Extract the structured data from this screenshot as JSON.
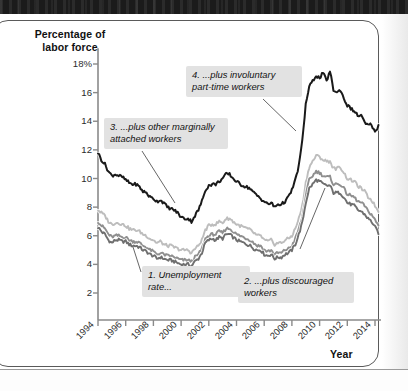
{
  "figure": {
    "y_axis_title": "Percentage of\nlabor force",
    "x_axis_title": "Year",
    "y_ticks": [
      "18%",
      "16",
      "14",
      "12",
      "10",
      "8",
      "6",
      "4",
      "2"
    ],
    "x_ticks": [
      "1994",
      "1996",
      "1998",
      "2000",
      "2002",
      "2004",
      "2006",
      "2008",
      "2010",
      "2012",
      "2014"
    ],
    "callouts": [
      {
        "id": "callout-1",
        "text": "1. Unemployment\nrate..."
      },
      {
        "id": "callout-2",
        "text": "2. ...plus discouraged\nworkers"
      },
      {
        "id": "callout-3",
        "text": "3. ...plus other marginally\nattached workers"
      },
      {
        "id": "callout-4",
        "text": "4. ...plus involuntary\npart-time workers"
      }
    ],
    "colors": {
      "series_u3": "#6f6f6f",
      "series_u4": "#8f8f8f",
      "series_u5": "#bdbdbd",
      "series_u6": "#1a1a1a",
      "axis": "#8a8a8a",
      "callout_bg": "#e2e2e2",
      "frame": "#5a5a5a"
    }
  },
  "chart_data": {
    "type": "line",
    "title": "",
    "subtitle": "",
    "xlabel": "Year",
    "ylabel": "Percentage of labor force",
    "xlim": [
      1994,
      2014.4
    ],
    "ylim": [
      0,
      19
    ],
    "grid": false,
    "legend": "annotations",
    "x_tick_values": [
      1994,
      1996,
      1998,
      2000,
      2002,
      2004,
      2006,
      2008,
      2010,
      2012,
      2014
    ],
    "y_tick_values": [
      2,
      4,
      6,
      8,
      10,
      12,
      14,
      16,
      18
    ],
    "x": [
      1994.0,
      1994.25,
      1994.5,
      1994.75,
      1995.0,
      1995.25,
      1995.5,
      1995.75,
      1996.0,
      1996.25,
      1996.5,
      1996.75,
      1997.0,
      1997.25,
      1997.5,
      1997.75,
      1998.0,
      1998.25,
      1998.5,
      1998.75,
      1999.0,
      1999.25,
      1999.5,
      1999.75,
      2000.0,
      2000.25,
      2000.5,
      2000.75,
      2001.0,
      2001.25,
      2001.5,
      2001.75,
      2002.0,
      2002.25,
      2002.5,
      2002.75,
      2003.0,
      2003.25,
      2003.5,
      2003.75,
      2004.0,
      2004.25,
      2004.5,
      2004.75,
      2005.0,
      2005.25,
      2005.5,
      2005.75,
      2006.0,
      2006.25,
      2006.5,
      2006.75,
      2007.0,
      2007.25,
      2007.5,
      2007.75,
      2008.0,
      2008.25,
      2008.5,
      2008.75,
      2009.0,
      2009.25,
      2009.5,
      2009.75,
      2010.0,
      2010.25,
      2010.5,
      2010.75,
      2011.0,
      2011.25,
      2011.5,
      2011.75,
      2012.0,
      2012.25,
      2012.5,
      2012.75,
      2013.0,
      2013.25,
      2013.5,
      2013.75,
      2014.0,
      2014.25
    ],
    "series": [
      {
        "name": "1. Unemployment rate (U-3)",
        "color": "#6f6f6f",
        "values": [
          6.6,
          6.3,
          6.1,
          5.7,
          5.5,
          5.7,
          5.7,
          5.6,
          5.6,
          5.4,
          5.3,
          5.3,
          5.2,
          5.0,
          4.9,
          4.7,
          4.6,
          4.4,
          4.5,
          4.4,
          4.3,
          4.3,
          4.2,
          4.1,
          4.0,
          4.0,
          4.0,
          3.9,
          4.2,
          4.4,
          4.8,
          5.5,
          5.7,
          5.8,
          5.7,
          5.9,
          5.8,
          6.1,
          6.1,
          5.9,
          5.7,
          5.6,
          5.5,
          5.4,
          5.3,
          5.1,
          5.0,
          5.0,
          4.7,
          4.6,
          4.7,
          4.4,
          4.5,
          4.5,
          4.7,
          4.8,
          5.0,
          5.4,
          6.1,
          6.9,
          8.3,
          9.3,
          9.6,
          9.9,
          9.8,
          9.6,
          9.5,
          9.5,
          9.0,
          9.0,
          9.0,
          8.7,
          8.3,
          8.2,
          8.1,
          7.8,
          7.7,
          7.5,
          7.2,
          7.0,
          6.6,
          6.2
        ]
      },
      {
        "name": "2. ...plus discouraged workers (U-4)",
        "color": "#8f8f8f",
        "values": [
          7.0,
          6.7,
          6.5,
          6.1,
          5.9,
          6.0,
          6.0,
          5.9,
          5.9,
          5.7,
          5.6,
          5.6,
          5.5,
          5.3,
          5.2,
          5.0,
          4.9,
          4.7,
          4.8,
          4.7,
          4.6,
          4.6,
          4.5,
          4.4,
          4.3,
          4.3,
          4.3,
          4.2,
          4.5,
          4.7,
          5.1,
          5.8,
          6.0,
          6.1,
          6.1,
          6.3,
          6.2,
          6.5,
          6.5,
          6.3,
          6.1,
          6.0,
          5.9,
          5.8,
          5.7,
          5.5,
          5.3,
          5.3,
          5.0,
          4.9,
          5.0,
          4.7,
          4.8,
          4.8,
          5.0,
          5.1,
          5.3,
          5.8,
          6.5,
          7.3,
          8.8,
          9.9,
          10.2,
          10.5,
          10.4,
          10.2,
          10.1,
          10.1,
          9.6,
          9.6,
          9.6,
          9.3,
          8.9,
          8.8,
          8.7,
          8.4,
          8.3,
          8.1,
          7.7,
          7.5,
          7.1,
          6.7
        ]
      },
      {
        "name": "3. ...plus other marginally attached workers (U-5)",
        "color": "#bdbdbd",
        "values": [
          7.8,
          7.6,
          7.4,
          7.0,
          6.8,
          6.9,
          6.9,
          6.8,
          6.7,
          6.5,
          6.4,
          6.4,
          6.3,
          6.1,
          6.0,
          5.8,
          5.7,
          5.5,
          5.6,
          5.4,
          5.3,
          5.3,
          5.2,
          5.1,
          5.0,
          5.0,
          5.0,
          4.8,
          5.1,
          5.3,
          5.7,
          6.4,
          6.7,
          6.8,
          6.8,
          7.0,
          6.9,
          7.2,
          7.2,
          7.0,
          6.8,
          6.7,
          6.6,
          6.5,
          6.4,
          6.2,
          6.0,
          6.0,
          5.7,
          5.6,
          5.7,
          5.4,
          5.5,
          5.5,
          5.7,
          5.8,
          6.0,
          6.5,
          7.2,
          8.1,
          9.7,
          10.8,
          11.2,
          11.6,
          11.5,
          11.3,
          11.2,
          11.2,
          10.7,
          10.7,
          10.8,
          10.4,
          10.0,
          9.9,
          9.8,
          9.5,
          9.3,
          9.1,
          8.7,
          8.5,
          8.1,
          7.7
        ]
      },
      {
        "name": "4. ...plus involuntary part-time workers (U-6)",
        "color": "#1a1a1a",
        "values": [
          11.8,
          11.3,
          11.0,
          10.5,
          10.2,
          10.3,
          10.2,
          10.1,
          9.9,
          9.7,
          9.6,
          9.6,
          9.4,
          9.1,
          9.0,
          8.7,
          8.6,
          8.4,
          8.5,
          8.3,
          8.0,
          7.9,
          7.8,
          7.6,
          7.3,
          7.2,
          7.2,
          7.0,
          7.4,
          7.8,
          8.4,
          9.2,
          9.5,
          9.6,
          9.6,
          9.8,
          10.0,
          10.3,
          10.3,
          10.0,
          9.8,
          9.6,
          9.5,
          9.4,
          9.3,
          9.0,
          8.8,
          8.6,
          8.4,
          8.2,
          8.3,
          8.0,
          8.2,
          8.2,
          8.4,
          8.7,
          9.2,
          9.9,
          10.9,
          12.6,
          15.2,
          16.4,
          16.8,
          17.2,
          17.0,
          17.4,
          16.8,
          17.5,
          16.2,
          16.0,
          16.2,
          15.6,
          15.1,
          14.9,
          14.7,
          14.4,
          14.4,
          13.9,
          13.7,
          13.8,
          13.2,
          13.7
        ]
      }
    ],
    "annotations": [
      {
        "label": "1. Unemployment rate...",
        "points_to_year": 1996.9,
        "points_to_value": 5.3
      },
      {
        "label": "2. ...plus discouraged workers",
        "points_to_year": 2011.3,
        "points_to_value": 9.6
      },
      {
        "label": "3. ...plus other marginally attached workers",
        "points_to_year": 2002.0,
        "points_to_value": 6.0
      },
      {
        "label": "4. ...plus involuntary part-time workers",
        "points_to_year": 2008.9,
        "points_to_value": 13.8
      }
    ]
  }
}
